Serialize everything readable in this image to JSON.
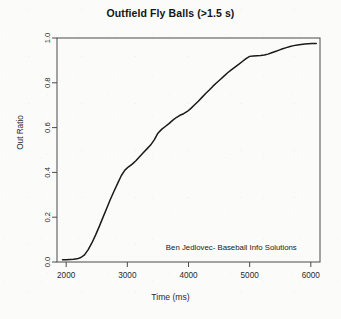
{
  "chart_data": {
    "type": "line",
    "title": "Outfield Fly Balls (>1.5 s)",
    "xlabel": "Time (ms)",
    "ylabel": "Out Ratio",
    "xlim": [
      1850,
      6150
    ],
    "ylim": [
      0.0,
      1.0
    ],
    "grid": false,
    "legend": null,
    "xticks": [
      2000,
      3000,
      4000,
      5000,
      6000
    ],
    "xtick_labels": [
      "2000",
      "3000",
      "4000",
      "5000",
      "6000"
    ],
    "yticks": [
      0.0,
      0.2,
      0.4,
      0.6,
      0.8,
      1.0
    ],
    "ytick_labels": [
      "0.0",
      "0.2",
      "0.4",
      "0.6",
      "0.8",
      "1.0"
    ],
    "annotations": [
      {
        "text": "Ben Jedlovec- Baseball Info Solutions",
        "x": 4700,
        "y": 0.055
      }
    ],
    "series": [
      {
        "name": "Out Ratio",
        "color": "#1a1a1a",
        "x": [
          1940,
          2000,
          2060,
          2120,
          2180,
          2240,
          2300,
          2360,
          2420,
          2480,
          2540,
          2600,
          2660,
          2720,
          2780,
          2840,
          2900,
          2960,
          3020,
          3080,
          3140,
          3200,
          3260,
          3320,
          3380,
          3440,
          3500,
          3560,
          3620,
          3680,
          3740,
          3800,
          3860,
          3920,
          3980,
          4040,
          4100,
          4160,
          4220,
          4280,
          4340,
          4400,
          4460,
          4520,
          4580,
          4640,
          4700,
          4760,
          4820,
          4880,
          4940,
          5000,
          5060,
          5120,
          5180,
          5240,
          5300,
          5360,
          5420,
          5480,
          5540,
          5600,
          5660,
          5720,
          5780,
          5840,
          5900,
          5960,
          6020,
          6090
        ],
        "y": [
          0.01,
          0.01,
          0.011,
          0.012,
          0.014,
          0.02,
          0.032,
          0.055,
          0.085,
          0.12,
          0.158,
          0.198,
          0.238,
          0.278,
          0.315,
          0.35,
          0.385,
          0.41,
          0.425,
          0.437,
          0.452,
          0.47,
          0.488,
          0.505,
          0.522,
          0.545,
          0.575,
          0.592,
          0.605,
          0.618,
          0.632,
          0.645,
          0.655,
          0.662,
          0.672,
          0.686,
          0.702,
          0.718,
          0.735,
          0.752,
          0.768,
          0.785,
          0.8,
          0.815,
          0.83,
          0.845,
          0.858,
          0.87,
          0.882,
          0.895,
          0.908,
          0.918,
          0.92,
          0.921,
          0.922,
          0.924,
          0.928,
          0.934,
          0.94,
          0.946,
          0.952,
          0.957,
          0.962,
          0.966,
          0.969,
          0.971,
          0.973,
          0.974,
          0.975,
          0.976
        ]
      }
    ]
  }
}
